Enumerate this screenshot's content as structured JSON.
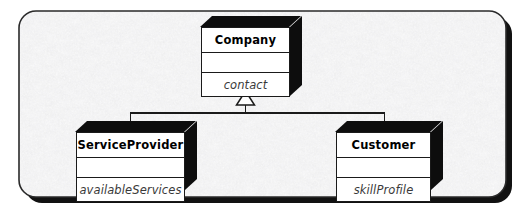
{
  "diagram": {
    "title": "UML Generalization Hierarchy",
    "type": "uml-class-diagram",
    "relationship": "generalization",
    "background_color": "#f0f0f0",
    "border_color": "#2a2a2a",
    "box_fill": "#ffffff",
    "box_line": "#1a1a1a",
    "extrusion_color": "#0d0d0d",
    "shadow_color": "#111111",
    "frame": {
      "x": 19,
      "y": 11,
      "width": 487,
      "height": 186,
      "corner_radius": 17,
      "shadow_offset": 5
    },
    "classes": [
      {
        "id": "company",
        "name": "Company",
        "role": "superclass",
        "compartments": {
          "operations": "",
          "attribute": "contact"
        }
      },
      {
        "id": "service-provider",
        "name": "ServiceProvider",
        "role": "subclass",
        "compartments": {
          "operations": "",
          "attribute": "availableServices"
        }
      },
      {
        "id": "customer",
        "name": "Customer",
        "role": "subclass",
        "compartments": {
          "operations": "",
          "attribute": "skillProfile"
        }
      }
    ],
    "connector": {
      "kind": "generalization-triangle",
      "arrow_fill": "#ffffff",
      "arrow_stroke": "#1a1a1a",
      "parent": "Company",
      "children": [
        "ServiceProvider",
        "Customer"
      ]
    }
  }
}
